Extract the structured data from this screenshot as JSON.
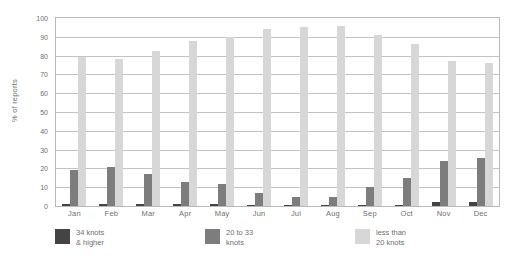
{
  "chart_data": {
    "type": "bar",
    "title": "",
    "xlabel": "",
    "ylabel": "% of reports",
    "ylim": [
      0,
      100
    ],
    "ytick_step": 10,
    "yticks": [
      100,
      90,
      80,
      70,
      60,
      50,
      40,
      30,
      20,
      10,
      0
    ],
    "grid": true,
    "legend_position": "bottom",
    "categories": [
      "Jan",
      "Feb",
      "Mar",
      "Apr",
      "May",
      "Jun",
      "Jul",
      "Aug",
      "Sep",
      "Oct",
      "Nov",
      "Dec"
    ],
    "series": [
      {
        "name": "34 knots\n& higher",
        "color": "#444444",
        "values": [
          1,
          1,
          1,
          1,
          1,
          0.5,
          0.5,
          0.5,
          0.5,
          0.5,
          2,
          2
        ]
      },
      {
        "name": "20 to 33\nknots",
        "color": "#7d7d7d",
        "values": [
          19,
          21,
          17,
          13,
          11.5,
          7,
          5,
          5,
          10,
          15,
          24,
          25.5
        ]
      },
      {
        "name": "less than\n20 knots",
        "color": "#d7d7d7",
        "values": [
          79,
          78,
          82.5,
          88,
          90,
          94,
          95,
          96,
          91,
          86,
          77,
          76
        ]
      }
    ]
  },
  "legend": [
    {
      "label": "34 knots\n& higher",
      "swatch": "dark"
    },
    {
      "label": "20 to 33\nknots",
      "swatch": "mid"
    },
    {
      "label": "less than\n20 knots",
      "swatch": "light"
    }
  ]
}
